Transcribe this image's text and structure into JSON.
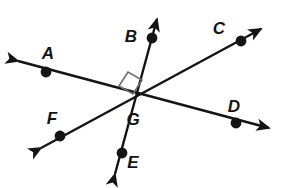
{
  "figure": {
    "type": "geometry-diagram",
    "background_color": "#ffffff",
    "line_color": "#141414",
    "point_color": "#141414",
    "right_angle_marker_color": "#6e6e6e",
    "labels": [
      {
        "id": "A",
        "text": "A",
        "x": 48,
        "y": 59
      },
      {
        "id": "B",
        "text": "B",
        "x": 131,
        "y": 42
      },
      {
        "id": "C",
        "text": "C",
        "x": 219,
        "y": 34
      },
      {
        "id": "D",
        "text": "D",
        "x": 234,
        "y": 112
      },
      {
        "id": "E",
        "text": "E",
        "x": 133,
        "y": 168
      },
      {
        "id": "F",
        "text": "F",
        "x": 52,
        "y": 124
      },
      {
        "id": "G",
        "text": "G",
        "x": 133,
        "y": 125
      }
    ],
    "points": [
      {
        "id": "A",
        "x": 46,
        "y": 72
      },
      {
        "id": "B",
        "x": 152,
        "y": 38
      },
      {
        "id": "C",
        "x": 241,
        "y": 41
      },
      {
        "id": "D",
        "x": 236,
        "y": 123
      },
      {
        "id": "E",
        "x": 122,
        "y": 153
      },
      {
        "id": "F",
        "x": 60,
        "y": 136
      },
      {
        "id": "G",
        "x": 135,
        "y": 98
      }
    ],
    "intersection": {
      "id": "G",
      "x": 135,
      "y": 98
    },
    "lines": [
      {
        "id": "line-AD",
        "through": [
          "A",
          "G",
          "D"
        ],
        "x1": 18,
        "y1": 61,
        "x2": 269,
        "y2": 128,
        "arrow_start": true,
        "arrow_end": true
      },
      {
        "id": "line-FC",
        "through": [
          "F",
          "G",
          "C"
        ],
        "x1": 41,
        "y1": 148,
        "x2": 261,
        "y2": 29,
        "arrow_start": true,
        "arrow_end": true
      },
      {
        "id": "line-EB",
        "through": [
          "E",
          "G",
          "B"
        ],
        "x1": 115,
        "y1": 174,
        "x2": 157,
        "y2": 19,
        "arrow_start": true,
        "arrow_end": true
      }
    ],
    "right_angle": {
      "at": "G",
      "between_lines": [
        "line-AD",
        "line-EB"
      ],
      "marker_points": "119,86 128,72 142,80 133,94"
    }
  }
}
